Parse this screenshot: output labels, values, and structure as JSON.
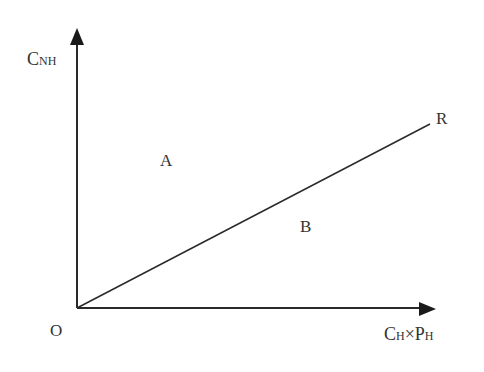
{
  "diagram": {
    "type": "region-boundary-plot",
    "axes": {
      "y_label": {
        "main": "C",
        "subscript": "NH"
      },
      "x_label": {
        "main1": "C",
        "sub1": "H",
        "operator": "×",
        "main2": "P",
        "sub2": "H"
      },
      "origin_label": "O"
    },
    "line": {
      "label": "R",
      "from": "origin",
      "direction": "upper-right"
    },
    "regions": [
      {
        "label": "A",
        "position": "above line"
      },
      {
        "label": "B",
        "position": "below line"
      }
    ],
    "colors": {
      "stroke": "#2a2a2a",
      "text": "#333333",
      "background": "#ffffff"
    }
  }
}
